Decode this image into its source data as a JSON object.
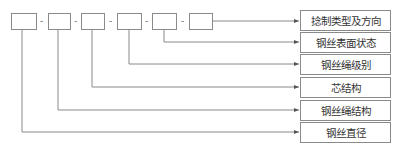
{
  "diagram": {
    "type": "code-structure",
    "code_boxes": 6,
    "separator": "-",
    "labels": [
      "捻制类型及方向",
      "钢丝表面状态",
      "钢丝绳级别",
      "芯结构",
      "钢丝绳结构",
      "钢丝直径"
    ],
    "line_color": "#8a8a8a"
  }
}
